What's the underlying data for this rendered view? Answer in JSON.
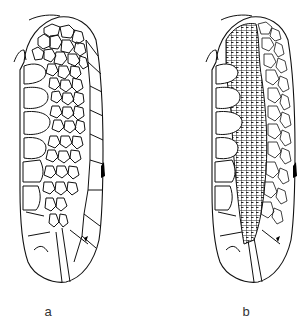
{
  "figure": {
    "panels": [
      {
        "id": "a",
        "label": "a",
        "pattern": "medium polygonal network"
      },
      {
        "id": "b",
        "label": "b",
        "pattern": "dense fine polygonal network in central band"
      }
    ]
  },
  "colors": {
    "line": "#111111",
    "background": "#ffffff",
    "label": "#333333"
  }
}
